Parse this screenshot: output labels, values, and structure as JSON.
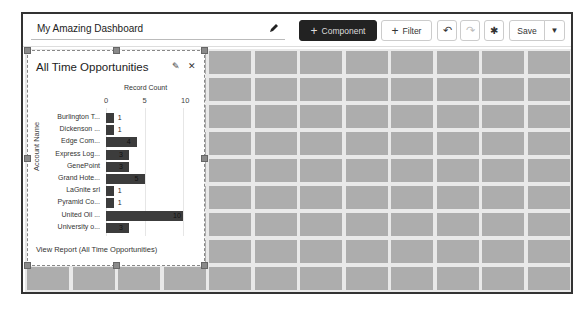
{
  "header": {
    "title": "My Amazing Dashboard",
    "edit_icon": "pencil-icon",
    "buttons": {
      "component": "Component",
      "filter": "Filter",
      "undo_icon": "undo-icon",
      "redo_icon": "redo-icon",
      "settings_icon": "gear-icon",
      "save": "Save",
      "save_menu_icon": "caret-down-icon"
    }
  },
  "widget": {
    "title": "All Time Opportunities",
    "edit_icon": "pencil-icon",
    "close_icon": "close-icon",
    "view_report": "View Report (All Time Opportunities)"
  },
  "chart_data": {
    "type": "bar",
    "orientation": "horizontal",
    "title": "All Time Opportunities",
    "xlabel": "Record Count",
    "ylabel": "Account Name",
    "xlim": [
      0,
      10
    ],
    "xticks": [
      "0",
      "5",
      "10"
    ],
    "categories": [
      "Burlington T...",
      "Dickenson ...",
      "Edge Com...",
      "Express Log...",
      "GenePoint",
      "Grand Hote...",
      "LaGnite srl",
      "Pyramid Co...",
      "United Oil ...",
      "University o..."
    ],
    "values": [
      1,
      1,
      4,
      3,
      3,
      5,
      1,
      1,
      10,
      3
    ],
    "labels": [
      "1",
      "1",
      "4",
      "3",
      "3",
      "5",
      "1",
      "1",
      "10",
      "3"
    ],
    "bar_color": "#3c3c3c"
  },
  "colors": {
    "component_button_bg": "#222222",
    "grid_cell": "#adadad",
    "grid_bg": "#e9e9e9"
  }
}
